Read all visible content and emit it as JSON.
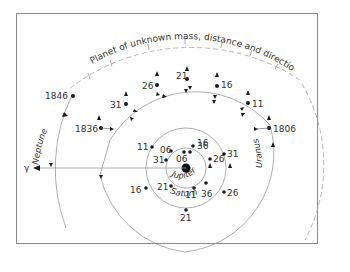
{
  "diagram": {
    "title_arc": "Planet of unknown mass, distance and direction",
    "vernal_equinox_symbol": "γ",
    "sun": {
      "label": ""
    },
    "orbits": {
      "jupiter": "Jupiter",
      "saturn": "Saturn",
      "uranus": "Uranus",
      "neptune": "Neptune"
    },
    "jupiter_positions": [
      "06",
      "16",
      "26",
      "36",
      "31",
      "21"
    ],
    "saturn_positions": [
      "36",
      "06",
      "11",
      "31",
      "26",
      "16",
      "21",
      "11"
    ],
    "uranus_positions": [
      "1806",
      "11",
      "16",
      "21",
      "26",
      "31",
      "1836"
    ],
    "neptune_positions": [
      "1846"
    ],
    "colors": {
      "line": "#9a9a9a",
      "dot": "#1a1a1a",
      "text": "#333333",
      "dashed": "#a0a0a0"
    }
  }
}
